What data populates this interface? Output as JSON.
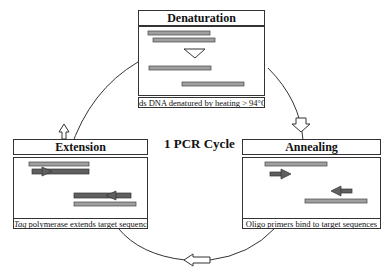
{
  "diagram": {
    "center_label": "1 PCR Cycle",
    "steps": [
      {
        "id": "denaturation",
        "title": "Denaturation",
        "caption": "ds DNA denatured by heating > 94°C"
      },
      {
        "id": "annealing",
        "title": "Annealing",
        "caption": "Oligo primers bind to target sequences"
      },
      {
        "id": "extension",
        "title": "Extension",
        "caption_italic": "Taq",
        "caption": " polymerase extends target sequences"
      }
    ],
    "colors": {
      "light_strand": "#a0a0a0",
      "dark_strand": "#606060",
      "outline": "#333333"
    }
  }
}
